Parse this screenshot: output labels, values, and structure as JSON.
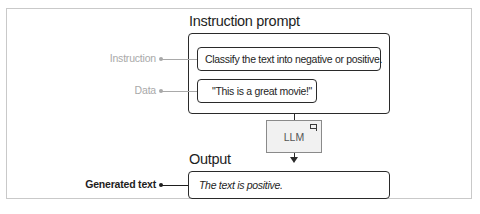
{
  "diagram": {
    "prompt_title": "Instruction prompt",
    "output_title": "Output",
    "labels": {
      "instruction": "Instruction",
      "data": "Data",
      "generated_text": "Generated text"
    },
    "prompt": {
      "instruction_text": "Classify the text into negative or positive.",
      "data_text": "\"This is a great movie!\""
    },
    "model": {
      "label": "LLM",
      "icon": "chat-bubble-icon"
    },
    "output": {
      "text": "The text is positive."
    },
    "colors": {
      "line": "#2a2a2a",
      "muted_label": "#a9a9a9",
      "llm_fill": "#f1f1f1",
      "frame_border": "#c9c9c9"
    }
  }
}
